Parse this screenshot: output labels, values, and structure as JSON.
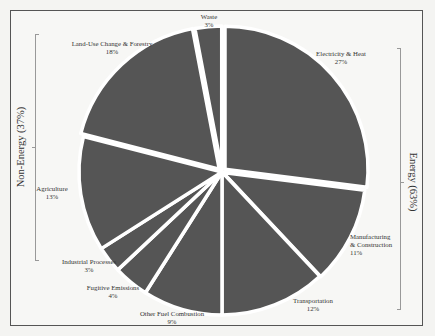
{
  "chart_data": {
    "type": "pie",
    "title": "",
    "start_angle_deg": 0,
    "direction": "clockwise",
    "categories": [
      "Electricity & Heat",
      "Manufacturing & Construction",
      "Transportation",
      "Other Fuel Combustion",
      "Fugitive Emissions",
      "Industrial Processes",
      "Agriculture",
      "Land-Use Change & Forestry",
      "Waste"
    ],
    "values": [
      27,
      11,
      12,
      9,
      4,
      3,
      13,
      18,
      3
    ],
    "value_labels": [
      "27%",
      "11%",
      "12%",
      "9%",
      "4%",
      "3%",
      "13%",
      "18%",
      "3%"
    ],
    "groups": [
      {
        "name": "Energy",
        "share": "63%",
        "members": [
          "Electricity & Heat",
          "Manufacturing & Construction",
          "Transportation",
          "Other Fuel Combustion",
          "Fugitive Emissions"
        ]
      },
      {
        "name": "Non-Energy",
        "share": "37%",
        "members": [
          "Industrial Processes",
          "Agriculture",
          "Land-Use Change & Forestry",
          "Waste"
        ]
      }
    ],
    "colors": {
      "slice": "#555555",
      "separator": "#ffffff"
    },
    "legend": "none"
  },
  "labels": {
    "electricity": {
      "name": "Electricity & Heat",
      "pct": "27%"
    },
    "manufacturing": {
      "name1": "Manufacturing",
      "name2": "& Construction",
      "pct": "11%"
    },
    "transportation": {
      "name": "Transportation",
      "pct": "12%"
    },
    "other_fuel": {
      "name": "Other Fuel Combustion",
      "pct": "9%"
    },
    "fugitive": {
      "name": "Fugitive Emissions",
      "pct": "4%"
    },
    "industrial": {
      "name": "Industrial Processes",
      "pct": "3%"
    },
    "agriculture": {
      "name": "Agriculture",
      "pct": "13%"
    },
    "landuse": {
      "name": "Land-Use Change & Forestry",
      "pct": "18%"
    },
    "waste": {
      "name": "Waste",
      "pct": "3%"
    }
  },
  "group_labels": {
    "energy": "Energy (63%)",
    "non_energy": "Non-Energy (37%)"
  }
}
